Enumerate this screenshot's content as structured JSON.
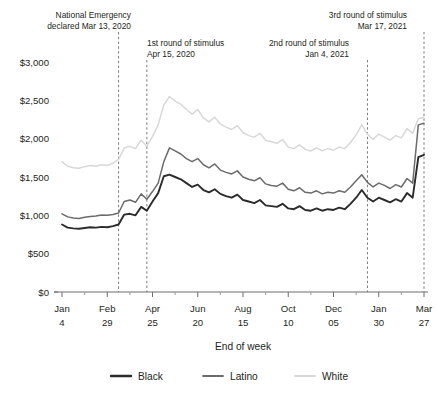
{
  "chart_data": {
    "type": "line",
    "title": "",
    "xlabel": "End of week",
    "ylabel": "",
    "ylim": [
      0,
      3000
    ],
    "ytick_values": [
      0,
      500,
      1000,
      1500,
      2000,
      2500,
      3000
    ],
    "ytick_labels": [
      "$0",
      "$500",
      "$1,000",
      "$1,500",
      "$2,000",
      "$2,500",
      "$3,000"
    ],
    "grid": false,
    "legend_position": "bottom",
    "xtick_labels": [
      {
        "month": "Jan",
        "day": "4"
      },
      {
        "month": "Feb",
        "day": "29"
      },
      {
        "month": "Apr",
        "day": "25"
      },
      {
        "month": "Jun",
        "day": "20"
      },
      {
        "month": "Aug",
        "day": "15"
      },
      {
        "month": "Oct",
        "day": "10"
      },
      {
        "month": "Dec",
        "day": "05"
      },
      {
        "month": "Jan",
        "day": "30"
      },
      {
        "month": "Mar",
        "day": "27"
      }
    ],
    "xtick_indices": [
      0,
      8,
      16,
      24,
      32,
      40,
      48,
      56,
      64
    ],
    "n_points": 65,
    "annotations": [
      {
        "id": "national-emergency",
        "line1": "National Emergency",
        "line2": "declared Mar 13, 2020",
        "x_index": 10,
        "align": "end",
        "text_x": 131,
        "text_y": 18
      },
      {
        "id": "first-stimulus",
        "line1": "1st round of stimulus",
        "line2": "Apr 15, 2020",
        "x_index": 15,
        "align": "start",
        "text_x": 147,
        "text_y": 46
      },
      {
        "id": "second-stimulus",
        "line1": "2nd round of stimulus",
        "line2": "Jan 4, 2021",
        "x_index": 54,
        "align": "end",
        "text_x": 349,
        "text_y": 46
      },
      {
        "id": "third-stimulus",
        "line1": "3rd round of stimulus",
        "line2": "Mar 17, 2021",
        "x_index": 64,
        "align": "end",
        "text_x": 407,
        "text_y": 18
      }
    ],
    "series": [
      {
        "name": "Black",
        "color": "#2b2b2b",
        "width": 1.9,
        "values": [
          880,
          840,
          830,
          825,
          835,
          845,
          840,
          850,
          845,
          860,
          880,
          1010,
          1020,
          1000,
          1110,
          1060,
          1180,
          1290,
          1510,
          1530,
          1500,
          1470,
          1420,
          1370,
          1400,
          1330,
          1300,
          1340,
          1280,
          1250,
          1230,
          1270,
          1200,
          1180,
          1160,
          1200,
          1130,
          1120,
          1110,
          1150,
          1090,
          1080,
          1120,
          1070,
          1060,
          1090,
          1060,
          1080,
          1070,
          1100,
          1080,
          1150,
          1230,
          1330,
          1230,
          1180,
          1230,
          1200,
          1170,
          1210,
          1180,
          1290,
          1230,
          1760,
          1790
        ]
      },
      {
        "name": "Latino",
        "color": "#6b6b6b",
        "width": 1.5,
        "values": [
          1020,
          980,
          965,
          960,
          975,
          985,
          990,
          1005,
          1000,
          1010,
          1030,
          1180,
          1200,
          1170,
          1280,
          1210,
          1310,
          1420,
          1700,
          1880,
          1840,
          1800,
          1740,
          1700,
          1740,
          1660,
          1620,
          1670,
          1590,
          1560,
          1540,
          1580,
          1500,
          1470,
          1450,
          1490,
          1410,
          1390,
          1380,
          1420,
          1340,
          1320,
          1360,
          1300,
          1290,
          1320,
          1280,
          1300,
          1290,
          1320,
          1300,
          1370,
          1450,
          1530,
          1430,
          1370,
          1420,
          1390,
          1350,
          1400,
          1370,
          1480,
          1420,
          2180,
          2200
        ]
      },
      {
        "name": "White",
        "color": "#d8d8d8",
        "width": 1.5,
        "values": [
          1700,
          1640,
          1620,
          1615,
          1635,
          1650,
          1640,
          1660,
          1650,
          1680,
          1730,
          1880,
          1900,
          1870,
          1980,
          1900,
          2030,
          2180,
          2440,
          2550,
          2490,
          2450,
          2380,
          2320,
          2380,
          2270,
          2220,
          2280,
          2190,
          2150,
          2120,
          2170,
          2080,
          2040,
          2020,
          2070,
          1980,
          1960,
          1940,
          1990,
          1890,
          1870,
          1920,
          1860,
          1840,
          1880,
          1840,
          1870,
          1850,
          1890,
          1870,
          1950,
          2050,
          2180,
          2060,
          1990,
          2060,
          2020,
          1980,
          2040,
          2010,
          2130,
          2070,
          2260,
          2280
        ]
      }
    ],
    "legend": [
      {
        "label": "Black",
        "color": "#2b2b2b",
        "width": 2.4
      },
      {
        "label": "Latino",
        "color": "#6b6b6b",
        "width": 1.8
      },
      {
        "label": "White",
        "color": "#d8d8d8",
        "width": 1.8
      }
    ]
  }
}
